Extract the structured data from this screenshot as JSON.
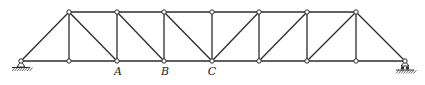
{
  "diagram": {
    "type": "pratt-truss",
    "panels": 8,
    "colors": {
      "member": "#2b2b2b",
      "node_fill": "#ffffff",
      "background": "#ffffff"
    },
    "bottom_nodes_x": [
      21,
      69,
      117,
      164,
      212,
      259,
      307,
      356,
      405
    ],
    "top_nodes_x": [
      69,
      117,
      164,
      212,
      259,
      307,
      356
    ],
    "bottom_y": 61,
    "top_y": 12,
    "labels": [
      {
        "text": "A",
        "x": 118,
        "y": 75
      },
      {
        "text": "B",
        "x": 165,
        "y": 75
      },
      {
        "text": "C",
        "x": 212,
        "y": 75
      }
    ],
    "supports": [
      {
        "type": "pin",
        "x": 21
      },
      {
        "type": "roller",
        "x": 405
      }
    ]
  }
}
